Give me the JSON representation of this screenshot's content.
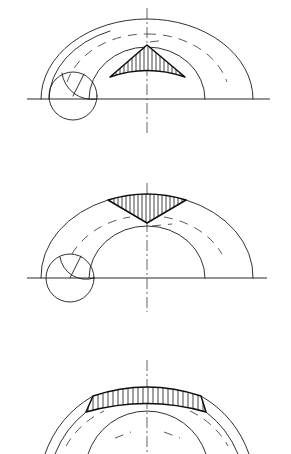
{
  "document": {
    "type": "engineering-drawing",
    "title": "Cycloid / epicycloid construction — three stages",
    "background_color": "#ffffff",
    "ink_color": "#1a1a1a",
    "hatch_color": "#111111",
    "canvas": {
      "width": 291,
      "height": 454
    }
  },
  "figures": [
    {
      "id": "figure-1",
      "label": "Figure 1",
      "baseline": {
        "y": 99,
        "x_start": 27,
        "x_end": 270
      },
      "centerline": {
        "x": 147,
        "y_start": 8,
        "y_end": 133
      },
      "rolling_circle": {
        "cx": 73,
        "cy": 96,
        "r": 24,
        "radius_mark_angle_deg": 62
      },
      "outer_arc": {
        "cx": 147,
        "cy": 100,
        "rx": 106,
        "ry": 80,
        "start_x": 41,
        "end_x": 253
      },
      "inner_arc": {
        "cx": 147,
        "cy": 100,
        "rx": 58,
        "ry": 52,
        "start_x": 89,
        "end_x": 205
      },
      "dashed_mid_arc": {
        "cx": 147,
        "cy": 100,
        "rx": 82,
        "ry": 66
      },
      "hatched_region": {
        "shape": "triangle-apex-up",
        "apex": {
          "x": 147,
          "y": 45
        },
        "left_corner": {
          "x": 110,
          "y": 77
        },
        "right_corner": {
          "x": 185,
          "y": 77
        },
        "hatch_direction": "vertical",
        "hatch_spacing": 4,
        "hatch_count": 18
      }
    },
    {
      "id": "figure-2",
      "label": "Figure 2",
      "baseline": {
        "y": 278,
        "x_start": 27,
        "x_end": 267
      },
      "centerline": {
        "x": 147,
        "y_start": 183,
        "y_end": 312
      },
      "rolling_circle": {
        "cx": 70,
        "cy": 278,
        "r": 24,
        "radius_mark_angle_deg": 62
      },
      "outer_arc": {
        "cx": 147,
        "cy": 280,
        "rx": 106,
        "ry": 82,
        "start_x": 41,
        "end_x": 253
      },
      "inner_arc": {
        "cx": 147,
        "cy": 280,
        "rx": 58,
        "ry": 52,
        "start_x": 89,
        "end_x": 205
      },
      "dashed_mid_arc": {
        "cx": 147,
        "cy": 280,
        "rx": 82,
        "ry": 68
      },
      "hatched_region": {
        "shape": "triangle-apex-down",
        "apex": {
          "x": 147,
          "y": 223
        },
        "left_corner": {
          "x": 108,
          "y": 200
        },
        "right_corner": {
          "x": 186,
          "y": 200
        },
        "hatch_direction": "vertical",
        "hatch_spacing": 4,
        "hatch_count": 19
      }
    },
    {
      "id": "figure-3",
      "label": "Figure 3",
      "clipped": "bottom of figure is cut off by image edge",
      "centerline": {
        "x": 147,
        "y_start": 360,
        "y_end": 454
      },
      "outer_arc": {
        "cx": 147,
        "cy": 500,
        "rx": 108,
        "ry": 108,
        "start_x": 45,
        "end_x": 249
      },
      "inner_arc": {
        "cx": 147,
        "cy": 500,
        "rx": 62,
        "ry": 62,
        "start_x": 88,
        "end_x": 206
      },
      "dashed_mid_arc": {
        "cx": 147,
        "cy": 500,
        "rx": 86,
        "ry": 86
      },
      "hatched_region": {
        "shape": "arc-band",
        "left_x": 86,
        "right_x": 206,
        "top_y": 395,
        "bottom_y": 432,
        "hatch_direction": "vertical",
        "hatch_spacing": 5,
        "hatch_count": 24
      }
    }
  ]
}
